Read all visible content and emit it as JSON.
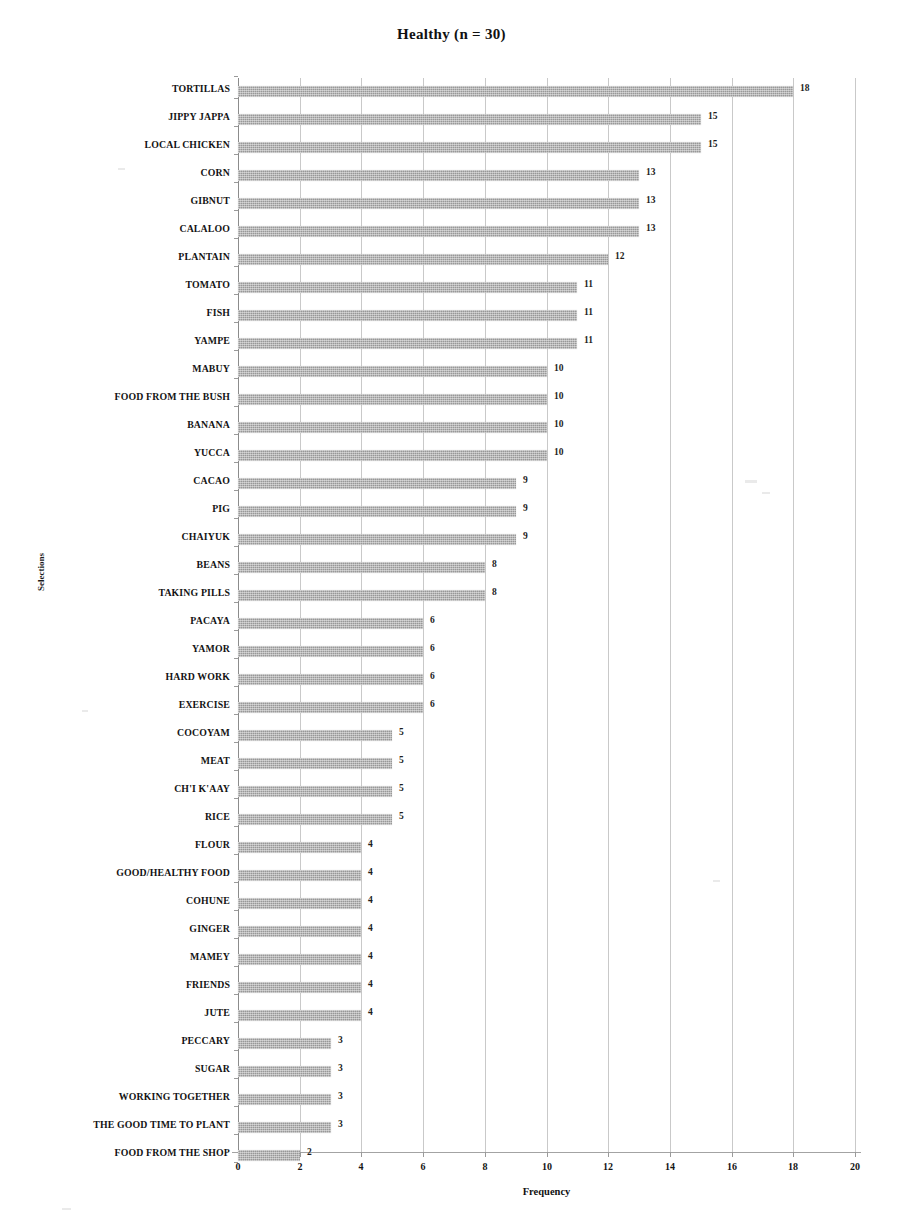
{
  "chart_data": {
    "type": "bar",
    "orientation": "horizontal",
    "title": "Healthy  (n = 30)",
    "xlabel": "Frequency",
    "ylabel": "Selections",
    "xlim": [
      0,
      20
    ],
    "xticks": [
      0,
      2,
      4,
      6,
      8,
      10,
      12,
      14,
      16,
      18,
      20
    ],
    "grid": "vertical",
    "legend": "none",
    "bar_color": "#989898",
    "data_labels": true,
    "categories": [
      "TORTILLAS",
      "JIPPY JAPPA",
      "LOCAL CHICKEN",
      "CORN",
      "GIBNUT",
      "CALALOO",
      "PLANTAIN",
      "TOMATO",
      "FISH",
      "YAMPE",
      "MABUY",
      "FOOD FROM THE BUSH",
      "BANANA",
      "YUCCA",
      "CACAO",
      "PIG",
      "CHAIYUK",
      "BEANS",
      "TAKING PILLS",
      "PACAYA",
      "YAMOR",
      "HARD WORK",
      "EXERCISE",
      "COCOYAM",
      "MEAT",
      "CH'I K'AAY",
      "RICE",
      "FLOUR",
      "GOOD/HEALTHY FOOD",
      "COHUNE",
      "GINGER",
      "MAMEY",
      "FRIENDS",
      "JUTE",
      "PECCARY",
      "SUGAR",
      "WORKING TOGETHER",
      "THE GOOD TIME TO PLANT",
      "FOOD FROM THE SHOP"
    ],
    "values": [
      18,
      15,
      15,
      13,
      13,
      13,
      12,
      11,
      11,
      11,
      10,
      10,
      10,
      10,
      9,
      9,
      9,
      8,
      8,
      6,
      6,
      6,
      6,
      5,
      5,
      5,
      5,
      4,
      4,
      4,
      4,
      4,
      4,
      4,
      3,
      3,
      3,
      3,
      2
    ]
  }
}
